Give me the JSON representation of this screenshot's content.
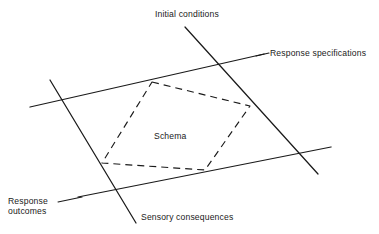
{
  "figure": {
    "kind": "line-diagram",
    "background_color": "#ffffff",
    "stroke_color": "#1a1a1a",
    "text_color": "#1a1a1a",
    "width": 379,
    "height": 234
  },
  "labels": {
    "initial_conditions": "Initial conditions",
    "response_specifications": "Response specifications",
    "schema": "Schema",
    "response_outcomes": "Response\noutcomes",
    "response_outcomes_line1": "Response",
    "response_outcomes_line2": "outcomes",
    "sensory_consequences": "Sensory consequences"
  },
  "solid_lines": [
    {
      "name": "initial-conditions-line",
      "label": "Initial conditions",
      "x1": 185,
      "y1": 27,
      "x2": 318,
      "y2": 174
    },
    {
      "name": "response-specifications-line",
      "label": "Response specifications",
      "x1": 30,
      "y1": 107,
      "x2": 264,
      "y2": 54
    },
    {
      "name": "response-outcomes-line",
      "label": "Response outcomes",
      "x1": 50,
      "y1": 80,
      "x2": 136,
      "y2": 223
    },
    {
      "name": "sensory-consequences-line",
      "label": "Sensory consequences",
      "x1": 78,
      "y1": 197,
      "x2": 331,
      "y2": 147
    }
  ],
  "leader_lines": [
    {
      "name": "response-specifications-leader",
      "x1": 256,
      "y1": 56,
      "x2": 269,
      "y2": 53
    },
    {
      "name": "response-outcomes-leader",
      "x1": 58,
      "y1": 202,
      "x2": 82,
      "y2": 197
    }
  ],
  "dashed_region": {
    "name": "schema-pentagon",
    "label": "Schema",
    "dash_pattern": "7 5",
    "vertices": [
      {
        "x": 152,
        "y": 82
      },
      {
        "x": 250,
        "y": 106
      },
      {
        "x": 205,
        "y": 170
      },
      {
        "x": 102,
        "y": 163
      }
    ]
  }
}
